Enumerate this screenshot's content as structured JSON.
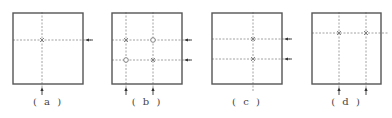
{
  "colors": {
    "frame": "#555555",
    "dashed": "#8a8a8a",
    "marker": "#777777",
    "arrow": "#333333",
    "label": "#444444"
  },
  "panels": [
    {
      "label": "( a )",
      "box": {
        "x": 13,
        "y": 13,
        "w": 70,
        "h": 71
      },
      "vlines": [
        42
      ],
      "hlines": [
        40
      ],
      "markers": [
        {
          "x": 42,
          "y": 40,
          "type": "x"
        }
      ],
      "arrows_right": [
        40
      ],
      "arrows_bottom": [
        42
      ]
    },
    {
      "label": "( b )",
      "box": {
        "x": 112,
        "y": 13,
        "w": 70,
        "h": 71
      },
      "vlines": [
        126,
        153
      ],
      "hlines": [
        40,
        60
      ],
      "markers": [
        {
          "x": 126,
          "y": 40,
          "type": "x"
        },
        {
          "x": 153,
          "y": 40,
          "type": "o"
        },
        {
          "x": 126,
          "y": 60,
          "type": "o"
        },
        {
          "x": 153,
          "y": 60,
          "type": "x"
        }
      ],
      "arrows_right": [
        40,
        60
      ],
      "arrows_bottom": [
        126,
        153
      ]
    },
    {
      "label": "( c )",
      "box": {
        "x": 212,
        "y": 13,
        "w": 70,
        "h": 71
      },
      "vlines": [
        253
      ],
      "hlines": [
        39,
        59
      ],
      "markers": [
        {
          "x": 253,
          "y": 39,
          "type": "x"
        },
        {
          "x": 253,
          "y": 59,
          "type": "x"
        }
      ],
      "arrows_right": [
        39,
        59
      ],
      "arrows_bottom": []
    },
    {
      "label": "( d )",
      "box": {
        "x": 312,
        "y": 13,
        "w": 69,
        "h": 71
      },
      "vlines": [
        339,
        366
      ],
      "hlines": [
        33
      ],
      "markers": [
        {
          "x": 339,
          "y": 33,
          "type": "x"
        },
        {
          "x": 366,
          "y": 33,
          "type": "x"
        }
      ],
      "arrows_right": [],
      "arrows_bottom": [
        339,
        366
      ]
    }
  ]
}
